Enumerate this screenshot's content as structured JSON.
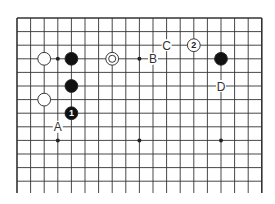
{
  "diagram": {
    "type": "go-board-fragment",
    "grid": {
      "origin_x": 17,
      "origin_y": 18,
      "spacing": 13.6,
      "columns": 19,
      "rows": 14,
      "line_color": "#333333",
      "top_edge": true,
      "left_edge": true,
      "right_edge": true,
      "bottom_edge": false
    },
    "hoshi": [
      {
        "col": 3,
        "row": 3
      },
      {
        "col": 9,
        "row": 3
      },
      {
        "col": 15,
        "row": 3
      },
      {
        "col": 3,
        "row": 9
      },
      {
        "col": 9,
        "row": 9
      },
      {
        "col": 15,
        "row": 9
      }
    ],
    "stones": [
      {
        "color": "white",
        "col": 2,
        "row": 3,
        "label": ""
      },
      {
        "color": "black",
        "col": 4,
        "row": 3,
        "label": ""
      },
      {
        "color": "white",
        "col": 7,
        "row": 3,
        "label": "",
        "marker": "circle"
      },
      {
        "color": "black",
        "col": 15,
        "row": 3,
        "label": ""
      },
      {
        "color": "white",
        "col": 13,
        "row": 2,
        "label": "2"
      },
      {
        "color": "black",
        "col": 4,
        "row": 5,
        "label": ""
      },
      {
        "color": "white",
        "col": 2,
        "row": 6,
        "label": ""
      },
      {
        "color": "black",
        "col": 4,
        "row": 7,
        "label": "1"
      }
    ],
    "letters": [
      {
        "text": "A",
        "col": 3,
        "row": 8
      },
      {
        "text": "B",
        "col": 10,
        "row": 3
      },
      {
        "text": "C",
        "col": 11,
        "row": 2
      },
      {
        "text": "D",
        "col": 15,
        "row": 5
      }
    ]
  }
}
